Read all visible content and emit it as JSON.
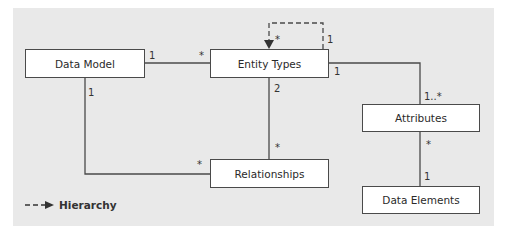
{
  "diagram": {
    "entities": [
      {
        "id": "data_model",
        "label": "Data Model"
      },
      {
        "id": "entity_types",
        "label": "Entity Types"
      },
      {
        "id": "attributes",
        "label": "Attributes"
      },
      {
        "id": "relationships",
        "label": "Relationships"
      },
      {
        "id": "data_elements",
        "label": "Data Elements"
      }
    ],
    "connections": [
      {
        "from": "data_model",
        "to": "entity_types",
        "from_mult": "1",
        "to_mult": "*",
        "style": "solid"
      },
      {
        "from": "entity_types",
        "to": "attributes",
        "from_mult": "1",
        "to_mult": "1..*",
        "style": "solid"
      },
      {
        "from": "entity_types",
        "to": "relationships",
        "from_mult": "2",
        "to_mult": "*",
        "style": "solid"
      },
      {
        "from": "data_model",
        "to": "relationships",
        "from_mult": "1",
        "to_mult": "*",
        "style": "solid"
      },
      {
        "from": "attributes",
        "to": "data_elements",
        "from_mult": "*",
        "to_mult": "1",
        "style": "solid"
      },
      {
        "from": "entity_types",
        "to": "entity_types",
        "from_mult": "1",
        "to_mult": "*",
        "style": "dashed-arrow"
      }
    ],
    "legend": {
      "symbol": "dashed-arrow",
      "label": "Hierarchy"
    }
  },
  "colors": {
    "background": "#e9e9e9",
    "box_fill": "#ffffff",
    "line": "#4a4a4a"
  }
}
